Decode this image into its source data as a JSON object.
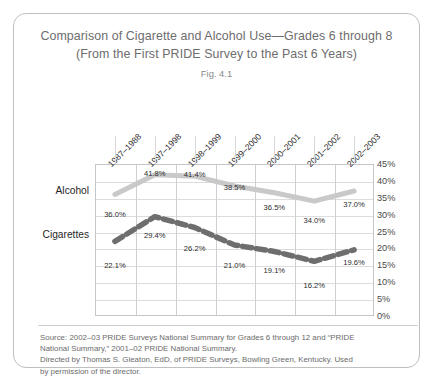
{
  "figure": {
    "title_line_1": "Comparison of Cigarette and Alcohol Use—Grades 6 through 8",
    "title_line_2": "(From the First PRIDE Survey to the Past 6 Years)",
    "fig_number": "Fig. 4.1",
    "source_line_1": "Source: 2002–03 PRIDE Surveys National Summary for Grades 6 through 12 and “PRIDE",
    "source_line_2": "National Summary,” 2001–02 PRIDE National Summary.",
    "source_line_3": "Directed by Thomas S. Gleaton, EdD, of PRIDE Surveys, Bowling Green, Kentucky. Used",
    "source_line_4": "by permission of the director."
  },
  "colors": {
    "alcohol_line": "#c9c9c9",
    "cigarettes_line": "#6e6e6e",
    "border": "#bfbfbf",
    "grid": "#dcdcdc",
    "text": "#6d6d6d"
  },
  "chart_data": {
    "type": "line",
    "title": "Comparison of Cigarette and Alcohol Use—Grades 6 through 8 (From the First PRIDE Survey to the Past 6 Years)",
    "xlabel": "",
    "ylabel": "",
    "ylim": [
      0,
      45
    ],
    "ytick_labels": [
      "45%",
      "40%",
      "35%",
      "30%",
      "25%",
      "20%",
      "15%",
      "10%",
      "5%",
      "0%"
    ],
    "ytick_values": [
      45,
      40,
      35,
      30,
      25,
      20,
      15,
      10,
      5,
      0
    ],
    "grid": true,
    "legend_position": "left-inline",
    "categories": [
      "1987–1988",
      "1997–1998",
      "1998–1999",
      "1999–2000",
      "2000–2001",
      "2001–2002",
      "2002–2003"
    ],
    "series": [
      {
        "name": "Alcohol",
        "style": "solid",
        "color": "#c9c9c9",
        "values": [
          36.0,
          41.8,
          41.4,
          38.5,
          36.5,
          34.0,
          37.0
        ],
        "labels": [
          "36.0%",
          "41.8%",
          "41.4%",
          "38.5%",
          "36.5%",
          "34.0%",
          "37.0%"
        ]
      },
      {
        "name": "Cigarettes",
        "style": "dashed",
        "color": "#6e6e6e",
        "values": [
          22.1,
          29.4,
          26.2,
          21.0,
          19.1,
          16.2,
          19.6
        ],
        "labels": [
          "22.1%",
          "29.4%",
          "26.2%",
          "21.0%",
          "19.1%",
          "16.2%",
          "19.6%"
        ]
      }
    ]
  }
}
